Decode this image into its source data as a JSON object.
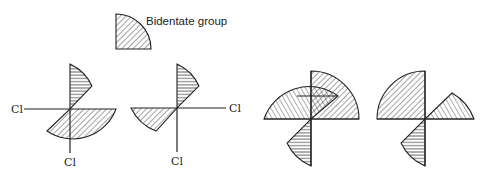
{
  "legend": {
    "label": "Bidentate group",
    "icon": "quarter-circle-hatched"
  },
  "structures": [
    {
      "id": "isomer-1",
      "ligands": [
        "Cl",
        "Cl"
      ],
      "bidentate_count": 2,
      "labels": {
        "left": "Cl",
        "bottom": "Cl"
      }
    },
    {
      "id": "isomer-2",
      "ligands": [
        "Cl",
        "Cl"
      ],
      "bidentate_count": 2,
      "labels": {
        "right": "Cl",
        "bottom": "Cl"
      }
    },
    {
      "id": "isomer-3",
      "ligands": [],
      "bidentate_count": 3
    },
    {
      "id": "isomer-4",
      "ligands": [],
      "bidentate_count": 3
    }
  ],
  "colors": {
    "stroke": "#222222",
    "background": "#ffffff"
  }
}
